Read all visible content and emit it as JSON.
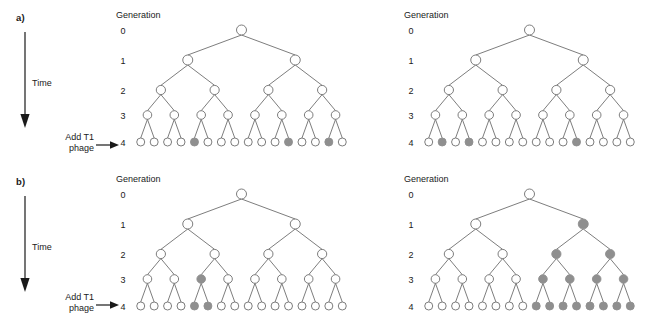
{
  "figure": {
    "panels": [
      {
        "id": "a",
        "label": "a)",
        "time_label": "Time",
        "add_phage_line1": "Add T1",
        "add_phage_line2": "phage",
        "generation_header": "Generation",
        "generation_numbers": [
          "0",
          "1",
          "2",
          "3",
          "4"
        ],
        "trees": [
          {
            "id": "a-left",
            "name": "culture-1",
            "levels": [
              {
                "generation": 0,
                "count": 1,
                "filled": []
              },
              {
                "generation": 1,
                "count": 2,
                "filled": []
              },
              {
                "generation": 2,
                "count": 4,
                "filled": []
              },
              {
                "generation": 3,
                "count": 8,
                "filled": []
              },
              {
                "generation": 4,
                "count": 16,
                "filled": [
                  5,
                  12,
                  15
                ]
              }
            ]
          },
          {
            "id": "a-right",
            "name": "culture-2",
            "levels": [
              {
                "generation": 0,
                "count": 1,
                "filled": []
              },
              {
                "generation": 1,
                "count": 2,
                "filled": []
              },
              {
                "generation": 2,
                "count": 4,
                "filled": []
              },
              {
                "generation": 3,
                "count": 8,
                "filled": []
              },
              {
                "generation": 4,
                "count": 16,
                "filled": [
                  2,
                  4,
                  12
                ]
              }
            ]
          }
        ]
      },
      {
        "id": "b",
        "label": "b)",
        "time_label": "Time",
        "add_phage_line1": "Add T1",
        "add_phage_line2": "phage",
        "generation_header": "Generation",
        "generation_numbers": [
          "0",
          "1",
          "2",
          "3",
          "4"
        ],
        "trees": [
          {
            "id": "b-left",
            "name": "culture-1",
            "levels": [
              {
                "generation": 0,
                "count": 1,
                "filled": []
              },
              {
                "generation": 1,
                "count": 2,
                "filled": []
              },
              {
                "generation": 2,
                "count": 4,
                "filled": []
              },
              {
                "generation": 3,
                "count": 8,
                "filled": [
                  3
                ]
              },
              {
                "generation": 4,
                "count": 16,
                "filled": [
                  5,
                  6
                ]
              }
            ]
          },
          {
            "id": "b-right",
            "name": "culture-2",
            "levels": [
              {
                "generation": 0,
                "count": 1,
                "filled": []
              },
              {
                "generation": 1,
                "count": 2,
                "filled": [
                  2
                ]
              },
              {
                "generation": 2,
                "count": 4,
                "filled": [
                  3,
                  4
                ]
              },
              {
                "generation": 3,
                "count": 8,
                "filled": [
                  5,
                  6,
                  7,
                  8
                ]
              },
              {
                "generation": 4,
                "count": 16,
                "filled": [
                  9,
                  10,
                  11,
                  12,
                  13,
                  14,
                  15,
                  16
                ]
              }
            ]
          }
        ]
      }
    ],
    "colors": {
      "resistant_fill": "#8f8f8f",
      "sensitive_fill": "#ffffff",
      "line": "#6e6e6e",
      "text": "#1a1a1a",
      "arrow": "#1a1a1a"
    }
  }
}
